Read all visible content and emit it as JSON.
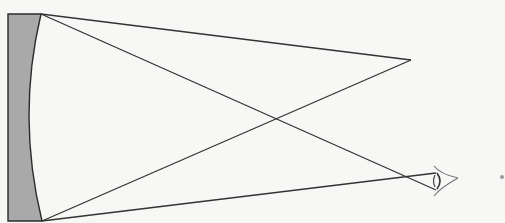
{
  "diagram": {
    "background": "#f7f7f6",
    "line_color": "#333333",
    "mirror": {
      "fill": "#a9a9a9",
      "stroke": "#2b2b2b",
      "back_edge_x": 8,
      "top": [
        41,
        14
      ],
      "bottom": [
        42,
        221
      ],
      "curve_apex": [
        29,
        117
      ]
    },
    "object_point": [
      411,
      60
    ],
    "eye_point": [
      436,
      176
    ],
    "rays": [
      {
        "from": [
          41,
          14
        ],
        "to": [
          411,
          60
        ]
      },
      {
        "from": [
          42,
          221
        ],
        "to": [
          411,
          60
        ]
      },
      {
        "from": [
          41,
          14
        ],
        "to": [
          436,
          190
        ]
      },
      {
        "from": [
          42,
          221
        ],
        "to": [
          436,
          173
        ]
      }
    ],
    "eye": {
      "icon": "eye-icon",
      "x": 434,
      "y": 166,
      "w": 24,
      "h": 30
    },
    "dot": {
      "x": 502,
      "y": 177,
      "r": 2
    }
  }
}
